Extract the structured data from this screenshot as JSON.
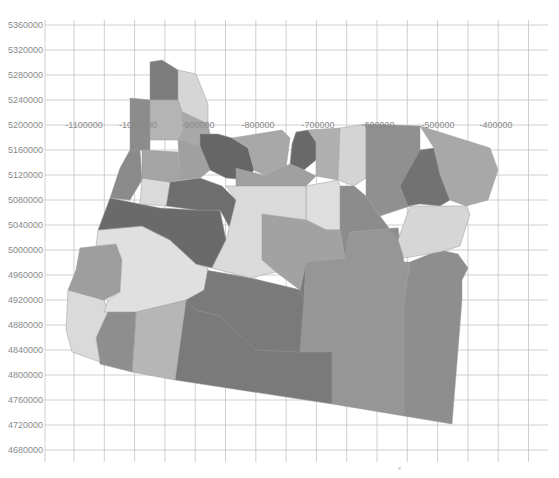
{
  "chart_data": {
    "type": "choropleth-map",
    "title": "",
    "region": "Oregon counties",
    "projection_units": "meters (projected coordinates)",
    "y_axis": {
      "label": "",
      "ticks": [
        "5360000",
        "5320000",
        "5280000",
        "5240000",
        "5200000",
        "5160000",
        "5120000",
        "5080000",
        "5040000",
        "5000000",
        "4960000",
        "4920000",
        "4880000",
        "4840000",
        "4800000",
        "4760000",
        "4720000",
        "4680000"
      ],
      "range": [
        4680000,
        5360000
      ]
    },
    "x_axis": {
      "label": "",
      "ticks": [
        "-1100000",
        "-1000000",
        "-900000",
        "-800000",
        "-700000",
        "-600000",
        "-500000",
        "-400000"
      ],
      "labels_positioned_on_y": 5200000
    },
    "grid": true,
    "legend": null,
    "fill_shades": {
      "very_light": "#dcdcdc",
      "light": "#c6c6c6",
      "medium": "#a8a8a8",
      "medium_dark": "#8e8e8e",
      "dark": "#737373",
      "darkest": "#626262"
    }
  },
  "footer_mark": "x"
}
